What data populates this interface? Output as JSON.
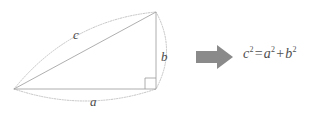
{
  "figure": {
    "background_color": "#ffffff"
  },
  "diagram": {
    "name": "right-triangle",
    "stroke_color": "#9a9a9a",
    "arc_color": "#b5b5b5",
    "label_color": "#4a4a4a",
    "right_angle_marker": true,
    "vertices": {
      "left": [
        14,
        89
      ],
      "top_right": [
        156,
        12
      ],
      "bottom_right": [
        156,
        89
      ]
    },
    "labels": {
      "hypotenuse": "c",
      "vertical_leg": "b",
      "horizontal_leg": "a"
    }
  },
  "arrow": {
    "label": "implies-arrow",
    "color": "#8a8a8a",
    "direction": "right"
  },
  "formula": {
    "full_text": "c² = a² + b²",
    "lhs_base": "c",
    "lhs_exponent": "2",
    "equals": "=",
    "term1_base": "a",
    "term1_exponent": "2",
    "plus": "+",
    "term2_base": "b",
    "term2_exponent": "2",
    "color": "#4f4f4f"
  }
}
